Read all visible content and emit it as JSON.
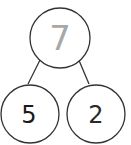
{
  "diagram": {
    "type": "number-bond",
    "whole": {
      "value": "7",
      "color": "#a8a8a8"
    },
    "parts": [
      {
        "value": "5",
        "color": "#1a1a1a"
      },
      {
        "value": "2",
        "color": "#2a2a2a"
      }
    ],
    "stroke_color": "#333333"
  }
}
